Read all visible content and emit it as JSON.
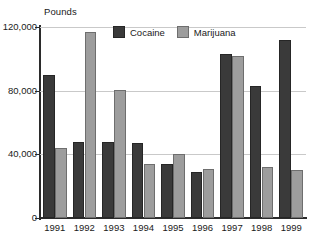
{
  "chart_data": {
    "type": "bar",
    "title": "",
    "subtitle": "",
    "xlabel": "",
    "ylabel": "Pounds",
    "ylim": [
      0,
      120000
    ],
    "ytick_values": [
      0,
      40000,
      80000,
      120000
    ],
    "ytick_labels": [
      "0",
      "40,000",
      "80,000",
      "120,000"
    ],
    "grid": true,
    "grid_axis": "y",
    "legend_position": "top-center",
    "categories": [
      "1991",
      "1992",
      "1993",
      "1994",
      "1995",
      "1996",
      "1997",
      "1998",
      "1999"
    ],
    "series": [
      {
        "name": "Cocaine",
        "color": "#3a3a3a",
        "values": [
          90000,
          48000,
          48000,
          47000,
          34000,
          29000,
          103000,
          83000,
          112000
        ]
      },
      {
        "name": "Marijuana",
        "color": "#9d9d9d",
        "values": [
          44000,
          117000,
          80500,
          34000,
          40500,
          31000,
          102000,
          32000,
          30000
        ]
      }
    ]
  },
  "legend": {
    "entries": [
      {
        "label": "Cocaine",
        "swatch": "cocaine-swatch"
      },
      {
        "label": "Marijuana",
        "swatch": "marijuana-swatch"
      }
    ]
  },
  "axis": {
    "y_unit_label": "Pounds"
  }
}
